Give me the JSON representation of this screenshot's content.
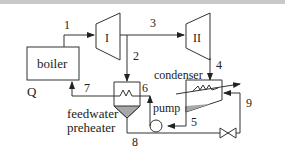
{
  "diagram": {
    "components": {
      "boiler": "boiler",
      "turbine_1": "I",
      "turbine_2": "II",
      "condenser": "condenser",
      "pump": "pump",
      "preheater_line1": "feedwater",
      "preheater_line2": "preheater",
      "heat_input": "Q"
    },
    "states": {
      "s1": "1",
      "s2": "2",
      "s3": "3",
      "s4": "4",
      "s5": "5",
      "s6": "6",
      "s7": "7",
      "s8": "8",
      "s9": "9"
    },
    "colors": {
      "line": "#333333",
      "liquid_fill": "#a8a8a8",
      "topbar": "#c8c8c8"
    }
  }
}
